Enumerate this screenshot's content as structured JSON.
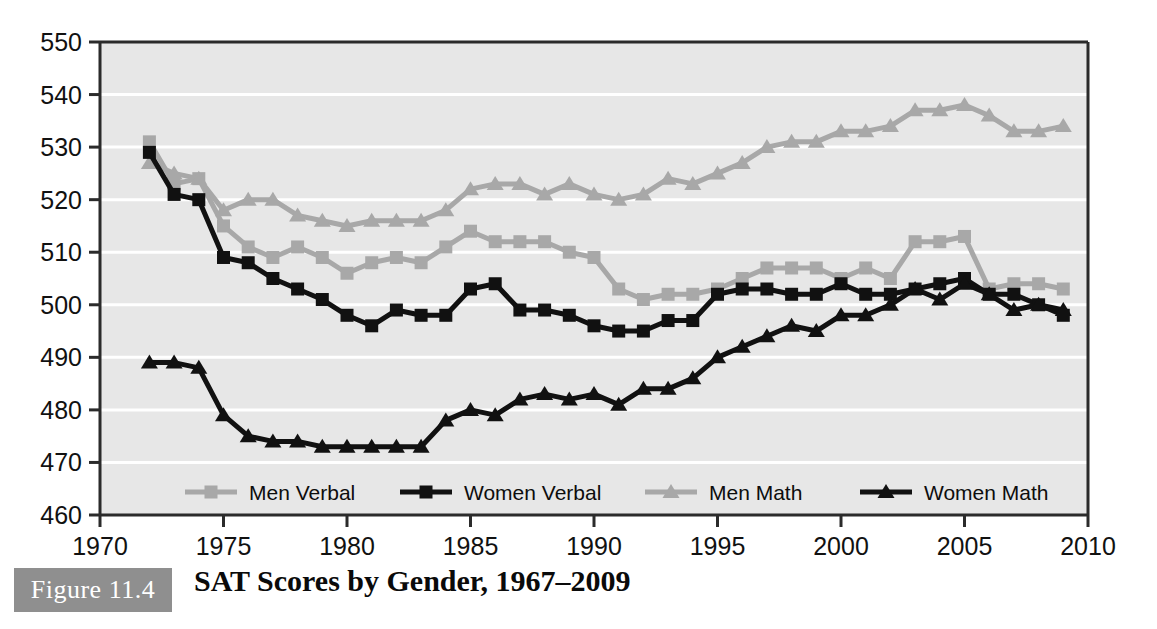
{
  "figure": {
    "badge_label": "Figure 11.4",
    "caption": "SAT Scores by Gender, 1967–2009"
  },
  "colors": {
    "plot_background": "#e7e7e7",
    "gridline": "#ffffff",
    "axis": "#2b2b2b",
    "men_series": "#a8a8a8",
    "women_series": "#111111",
    "text": "#111111",
    "badge_background": "#8f8f8f",
    "badge_text": "#ffffff"
  },
  "axes": {
    "y_label": "",
    "x_label": "",
    "y_ticks": [
      460,
      470,
      480,
      490,
      500,
      510,
      520,
      530,
      540,
      550
    ],
    "x_ticks": [
      1970,
      1975,
      1980,
      1985,
      1990,
      1995,
      2000,
      2005,
      2010
    ],
    "ylim": [
      460,
      550
    ],
    "xlim": [
      1970,
      2010
    ],
    "grid": true
  },
  "legend": {
    "position": "bottom-inside",
    "entries": [
      {
        "label": "Men Verbal",
        "color": "#a8a8a8",
        "marker": "square"
      },
      {
        "label": "Women Verbal",
        "color": "#111111",
        "marker": "square"
      },
      {
        "label": "Men Math",
        "color": "#a8a8a8",
        "marker": "triangle"
      },
      {
        "label": "Women Math",
        "color": "#111111",
        "marker": "triangle"
      }
    ]
  },
  "chart_data": {
    "type": "line",
    "title": "SAT Scores by Gender, 1967–2009",
    "xlabel": "",
    "ylabel": "",
    "xlim": [
      1970,
      2010
    ],
    "ylim": [
      460,
      550
    ],
    "grid": true,
    "legend_position": "bottom-inside",
    "x": [
      1972,
      1973,
      1974,
      1975,
      1976,
      1977,
      1978,
      1979,
      1980,
      1981,
      1982,
      1983,
      1984,
      1985,
      1986,
      1987,
      1988,
      1989,
      1990,
      1991,
      1992,
      1993,
      1994,
      1995,
      1996,
      1997,
      1998,
      1999,
      2000,
      2001,
      2002,
      2003,
      2004,
      2005,
      2006,
      2007,
      2008,
      2009
    ],
    "series": [
      {
        "name": "Men Verbal",
        "color": "#a8a8a8",
        "marker": "square",
        "values": [
          531,
          523,
          524,
          515,
          511,
          509,
          511,
          509,
          506,
          508,
          509,
          508,
          511,
          514,
          512,
          512,
          512,
          510,
          509,
          503,
          501,
          502,
          502,
          503,
          505,
          507,
          507,
          507,
          505,
          507,
          505,
          512,
          512,
          513,
          503,
          504,
          504,
          503
        ]
      },
      {
        "name": "Women Verbal",
        "color": "#111111",
        "marker": "square",
        "values": [
          529,
          521,
          520,
          509,
          508,
          505,
          503,
          501,
          498,
          496,
          499,
          498,
          498,
          503,
          504,
          499,
          499,
          498,
          496,
          495,
          495,
          497,
          497,
          502,
          503,
          503,
          502,
          502,
          504,
          502,
          502,
          503,
          504,
          505,
          502,
          502,
          500,
          498
        ]
      },
      {
        "name": "Men Math",
        "color": "#a8a8a8",
        "marker": "triangle",
        "values": [
          527,
          525,
          524,
          518,
          520,
          520,
          517,
          516,
          515,
          516,
          516,
          516,
          518,
          522,
          523,
          523,
          521,
          523,
          521,
          520,
          521,
          524,
          523,
          525,
          527,
          530,
          531,
          531,
          533,
          533,
          534,
          537,
          537,
          538,
          536,
          533,
          533,
          534
        ]
      },
      {
        "name": "Women Math",
        "color": "#111111",
        "marker": "triangle",
        "values": [
          489,
          489,
          488,
          479,
          475,
          474,
          474,
          473,
          473,
          473,
          473,
          473,
          478,
          480,
          479,
          482,
          483,
          482,
          483,
          481,
          484,
          484,
          486,
          490,
          492,
          494,
          496,
          495,
          498,
          498,
          500,
          503,
          501,
          504,
          502,
          499,
          500,
          499
        ]
      }
    ]
  }
}
